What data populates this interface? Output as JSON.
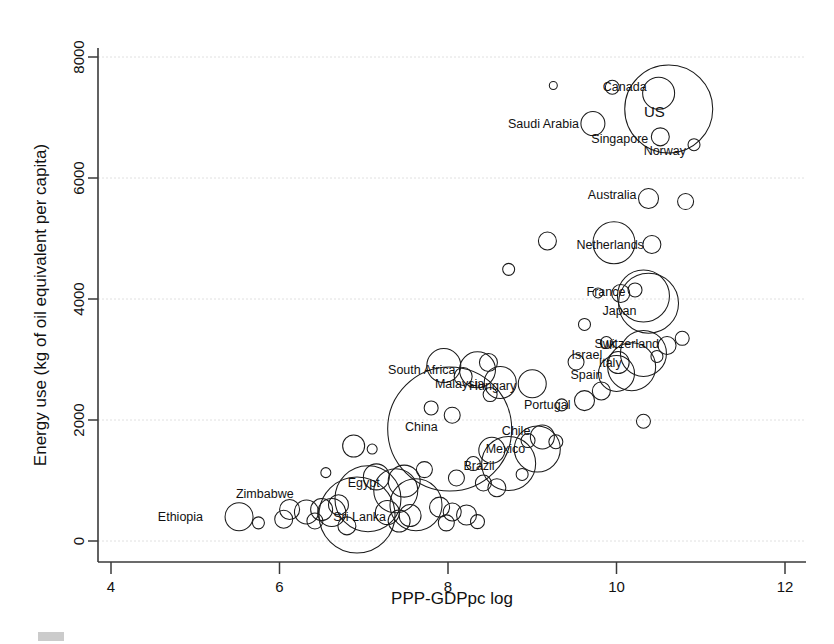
{
  "chart_data": {
    "type": "scatter",
    "title": "",
    "xlabel": "PPP-GDPpc log",
    "ylabel": "Energy use (kg of oil equivalent per capita)",
    "xlim": [
      4,
      12
    ],
    "ylim": [
      0,
      8000
    ],
    "xticks": [
      4,
      6,
      8,
      10,
      12
    ],
    "yticks": [
      0,
      2000,
      4000,
      6000,
      8000
    ],
    "grid": true,
    "legend": "none",
    "marker": "open-circle",
    "size_encoding": "bubble area proportional to population",
    "points": [
      {
        "label": "Ethiopia",
        "x": 5.52,
        "y": 400,
        "r": 14,
        "lx": -36,
        "ly": 4,
        "anchor": "end"
      },
      {
        "label": "Zimbabwe",
        "x": 6.5,
        "y": 520,
        "r": 11,
        "lx": -28,
        "ly": -12,
        "anchor": "end"
      },
      {
        "label": "Sri Lanka",
        "x": 7.55,
        "y": 420,
        "r": 11,
        "lx": -24,
        "ly": 5,
        "anchor": "end"
      },
      {
        "label": "Egypt",
        "x": 7.38,
        "y": 830,
        "r": 22,
        "lx": -16,
        "ly": -4,
        "anchor": "end"
      },
      {
        "label": "China",
        "x": 8.02,
        "y": 1850,
        "r": 62,
        "lx": -12,
        "ly": 2,
        "anchor": "end"
      },
      {
        "label": "Brazil",
        "x": 8.72,
        "y": 1280,
        "r": 27,
        "lx": -14,
        "ly": 6,
        "anchor": "end"
      },
      {
        "label": "Mexico",
        "x": 9.06,
        "y": 1520,
        "r": 23,
        "lx": -12,
        "ly": 4,
        "anchor": "end"
      },
      {
        "label": "Chile",
        "x": 9.12,
        "y": 1720,
        "r": 12,
        "lx": -12,
        "ly": -2,
        "anchor": "end"
      },
      {
        "label": "South Africa",
        "x": 8.35,
        "y": 2830,
        "r": 18,
        "lx": -22,
        "ly": 4,
        "anchor": "end"
      },
      {
        "label": "Malaysia",
        "x": 8.62,
        "y": 2620,
        "r": 16,
        "lx": -16,
        "ly": 6,
        "anchor": "end"
      },
      {
        "label": "Hungary",
        "x": 9.0,
        "y": 2600,
        "r": 14,
        "lx": -16,
        "ly": 6,
        "anchor": "end"
      },
      {
        "label": "Portugal",
        "x": 9.62,
        "y": 2320,
        "r": 10,
        "lx": -14,
        "ly": 8,
        "anchor": "end"
      },
      {
        "label": "Spain",
        "x": 10.0,
        "y": 2770,
        "r": 18,
        "lx": -14,
        "ly": 6,
        "anchor": "end"
      },
      {
        "label": "Israel",
        "x": 10.02,
        "y": 2950,
        "r": 11,
        "lx": -16,
        "ly": -4,
        "anchor": "end"
      },
      {
        "label": "Italy",
        "x": 10.18,
        "y": 2880,
        "r": 24,
        "lx": -10,
        "ly": 0,
        "anchor": "end"
      },
      {
        "label": "UK",
        "x": 10.32,
        "y": 3100,
        "r": 23,
        "lx": -26,
        "ly": -4,
        "anchor": "end"
      },
      {
        "label": "Switzerland",
        "x": 10.6,
        "y": 3230,
        "r": 9,
        "lx": -8,
        "ly": 2,
        "anchor": "end"
      },
      {
        "label": "France",
        "x": 10.32,
        "y": 4050,
        "r": 26,
        "lx": -18,
        "ly": 0,
        "anchor": "end"
      },
      {
        "label": "Japan",
        "x": 10.38,
        "y": 3930,
        "r": 30,
        "lx": -12,
        "ly": 12,
        "anchor": "end"
      },
      {
        "label": "Netherlands",
        "x": 10.42,
        "y": 4900,
        "r": 9,
        "lx": -8,
        "ly": 4,
        "anchor": "end"
      },
      {
        "label": "Australia",
        "x": 10.38,
        "y": 5660,
        "r": 10,
        "lx": -12,
        "ly": 0,
        "anchor": "end"
      },
      {
        "label": "Saudi Arabia",
        "x": 9.72,
        "y": 6900,
        "r": 12,
        "lx": -14,
        "ly": 4,
        "anchor": "end"
      },
      {
        "label": "Canada",
        "x": 10.5,
        "y": 7400,
        "r": 16,
        "lx": -12,
        "ly": -2,
        "anchor": "end"
      },
      {
        "label": "US",
        "x": 10.62,
        "y": 7140,
        "r": 44,
        "lx": -4,
        "ly": 8,
        "anchor": "end"
      },
      {
        "label": "Singapore",
        "x": 10.52,
        "y": 6680,
        "r": 9,
        "lx": -12,
        "ly": 6,
        "anchor": "end"
      },
      {
        "label": "Norway",
        "x": 10.92,
        "y": 6550,
        "r": 6,
        "lx": -8,
        "ly": 10,
        "anchor": "end"
      }
    ],
    "unlabeled_points": [
      {
        "x": 9.25,
        "y": 7530,
        "r": 4
      },
      {
        "x": 9.95,
        "y": 7500,
        "r": 7
      },
      {
        "x": 10.82,
        "y": 5610,
        "r": 8
      },
      {
        "x": 9.97,
        "y": 4930,
        "r": 21
      },
      {
        "x": 9.18,
        "y": 4960,
        "r": 9
      },
      {
        "x": 8.72,
        "y": 4490,
        "r": 6
      },
      {
        "x": 10.22,
        "y": 4150,
        "r": 7
      },
      {
        "x": 9.78,
        "y": 4100,
        "r": 5
      },
      {
        "x": 10.05,
        "y": 4090,
        "r": 9
      },
      {
        "x": 10.78,
        "y": 3350,
        "r": 7
      },
      {
        "x": 9.62,
        "y": 3580,
        "r": 6
      },
      {
        "x": 9.88,
        "y": 3280,
        "r": 6
      },
      {
        "x": 10.48,
        "y": 3050,
        "r": 6
      },
      {
        "x": 9.52,
        "y": 2960,
        "r": 8
      },
      {
        "x": 9.82,
        "y": 2480,
        "r": 9
      },
      {
        "x": 10.32,
        "y": 1980,
        "r": 7
      },
      {
        "x": 8.48,
        "y": 2950,
        "r": 9
      },
      {
        "x": 7.95,
        "y": 2900,
        "r": 17
      },
      {
        "x": 8.18,
        "y": 2720,
        "r": 9
      },
      {
        "x": 8.5,
        "y": 2420,
        "r": 7
      },
      {
        "x": 9.35,
        "y": 2250,
        "r": 6
      },
      {
        "x": 7.8,
        "y": 2200,
        "r": 7
      },
      {
        "x": 6.88,
        "y": 1570,
        "r": 11
      },
      {
        "x": 8.95,
        "y": 1660,
        "r": 7
      },
      {
        "x": 9.28,
        "y": 1640,
        "r": 7
      },
      {
        "x": 8.52,
        "y": 1500,
        "r": 13
      },
      {
        "x": 8.3,
        "y": 1280,
        "r": 7
      },
      {
        "x": 8.88,
        "y": 1100,
        "r": 6
      },
      {
        "x": 8.1,
        "y": 1040,
        "r": 8
      },
      {
        "x": 8.42,
        "y": 960,
        "r": 8
      },
      {
        "x": 8.58,
        "y": 880,
        "r": 9
      },
      {
        "x": 7.72,
        "y": 1180,
        "r": 8
      },
      {
        "x": 7.15,
        "y": 1060,
        "r": 13
      },
      {
        "x": 7.48,
        "y": 990,
        "r": 16
      },
      {
        "x": 7.05,
        "y": 700,
        "r": 33
      },
      {
        "x": 7.62,
        "y": 600,
        "r": 26
      },
      {
        "x": 6.92,
        "y": 430,
        "r": 38
      },
      {
        "x": 6.32,
        "y": 480,
        "r": 12
      },
      {
        "x": 6.12,
        "y": 520,
        "r": 10
      },
      {
        "x": 6.62,
        "y": 470,
        "r": 14
      },
      {
        "x": 6.7,
        "y": 600,
        "r": 10
      },
      {
        "x": 7.28,
        "y": 470,
        "r": 12
      },
      {
        "x": 7.9,
        "y": 560,
        "r": 10
      },
      {
        "x": 8.05,
        "y": 480,
        "r": 9
      },
      {
        "x": 8.22,
        "y": 430,
        "r": 10
      },
      {
        "x": 7.42,
        "y": 330,
        "r": 11
      },
      {
        "x": 6.05,
        "y": 360,
        "r": 9
      },
      {
        "x": 5.75,
        "y": 300,
        "r": 6
      },
      {
        "x": 6.42,
        "y": 330,
        "r": 8
      },
      {
        "x": 6.8,
        "y": 250,
        "r": 9
      },
      {
        "x": 7.98,
        "y": 300,
        "r": 8
      },
      {
        "x": 8.35,
        "y": 320,
        "r": 7
      },
      {
        "x": 6.55,
        "y": 1130,
        "r": 5
      },
      {
        "x": 7.1,
        "y": 1520,
        "r": 5
      },
      {
        "x": 8.05,
        "y": 2080,
        "r": 8
      }
    ]
  },
  "axes": {
    "x_title": "PPP-GDPpc log",
    "y_title": "Energy use (kg of oil equivalent per capita)",
    "x_tick_labels": [
      "4",
      "6",
      "8",
      "10",
      "12"
    ],
    "y_tick_labels": [
      "0",
      "2000",
      "4000",
      "6000",
      "8000"
    ]
  }
}
